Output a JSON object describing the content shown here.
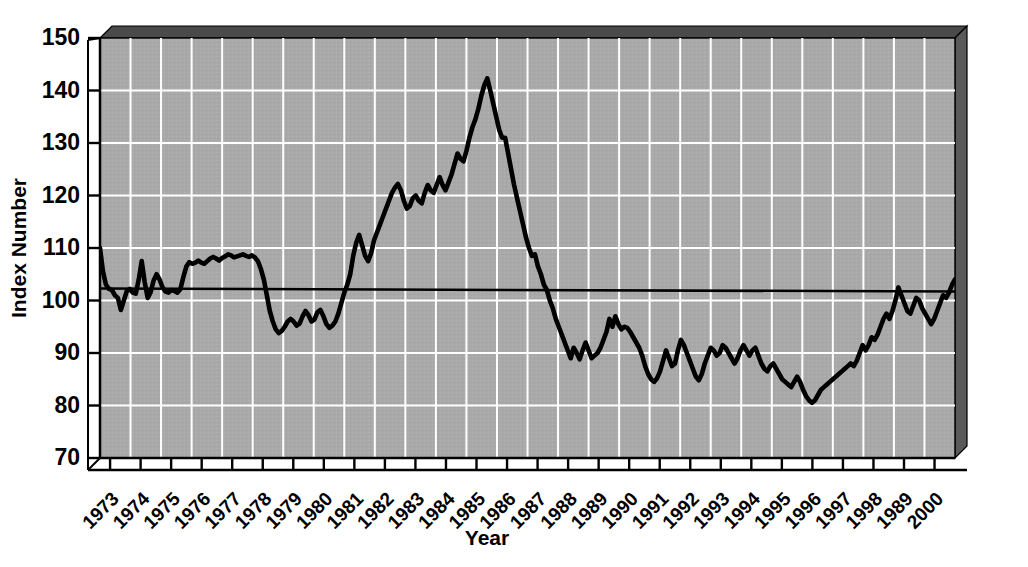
{
  "chart_data": {
    "type": "line",
    "title": "",
    "xlabel": "Year",
    "ylabel": "Index Number",
    "ylim": [
      70,
      150
    ],
    "yticks": [
      70,
      80,
      90,
      100,
      110,
      120,
      130,
      140,
      150
    ],
    "grid": true,
    "legend": null,
    "background_color": "#a9a9a9",
    "gridline_color": "#ffffff",
    "line_color": "#000000",
    "reference_line": {
      "value": 102,
      "color": "#000000",
      "label": ""
    },
    "xtick_labels": [
      "1973",
      "1974",
      "1975",
      "1976",
      "1977",
      "1978",
      "1979",
      "1980",
      "1981",
      "1982",
      "1983",
      "1984",
      "1985",
      "1986",
      "1987",
      "1988",
      "1989",
      "1990",
      "1991",
      "1992",
      "1993",
      "1994",
      "1995",
      "1996",
      "1997",
      "1998",
      "1989",
      "2000"
    ],
    "x_start": 1973.0,
    "x_end": 2000.75,
    "x_step_years": 0.0833333,
    "series": [
      {
        "name": "Index Number",
        "values": [
          110.0,
          105.5,
          103.0,
          102.2,
          102.0,
          101.0,
          100.5,
          98.2,
          100.0,
          101.8,
          102.2,
          101.5,
          101.3,
          104.0,
          107.5,
          103.5,
          100.5,
          101.6,
          103.8,
          105.0,
          104.0,
          102.5,
          101.7,
          101.5,
          102.0,
          101.8,
          101.5,
          102.2,
          104.5,
          106.5,
          107.3,
          107.0,
          107.2,
          107.6,
          107.2,
          107.0,
          107.5,
          108.0,
          108.3,
          108.0,
          107.6,
          108.1,
          108.4,
          108.8,
          108.6,
          108.2,
          108.4,
          108.6,
          108.8,
          108.5,
          108.3,
          108.6,
          108.2,
          107.5,
          106.0,
          104.0,
          101.0,
          98.0,
          96.0,
          94.5,
          93.8,
          94.2,
          95.0,
          96.0,
          96.5,
          96.0,
          95.2,
          95.6,
          97.0,
          98.0,
          97.2,
          96.0,
          96.4,
          97.8,
          98.2,
          97.0,
          95.5,
          94.8,
          95.2,
          96.0,
          97.5,
          99.5,
          101.5,
          103.0,
          105.0,
          108.5,
          111.0,
          112.5,
          110.5,
          108.5,
          107.5,
          109.0,
          111.5,
          113.0,
          114.5,
          116.0,
          117.5,
          119.0,
          120.5,
          121.5,
          122.2,
          121.0,
          119.0,
          117.5,
          118.0,
          119.5,
          120.0,
          119.0,
          118.5,
          120.5,
          122.0,
          121.0,
          120.5,
          122.0,
          123.5,
          122.0,
          121.0,
          122.5,
          124.0,
          126.0,
          128.0,
          127.0,
          126.5,
          128.5,
          131.0,
          133.0,
          134.5,
          136.5,
          139.0,
          141.0,
          142.3,
          140.0,
          137.5,
          135.0,
          132.5,
          131.0,
          131.0,
          128.0,
          125.0,
          122.0,
          119.5,
          117.0,
          114.5,
          112.0,
          110.0,
          108.5,
          108.8,
          106.5,
          105.0,
          103.0,
          102.0,
          100.0,
          98.5,
          96.5,
          95.0,
          93.5,
          92.0,
          90.5,
          89.0,
          91.0,
          90.0,
          88.8,
          90.5,
          92.0,
          90.5,
          89.0,
          89.5,
          90.0,
          91.0,
          92.5,
          94.0,
          96.5,
          95.0,
          97.0,
          95.5,
          94.5,
          95.0,
          94.8,
          94.0,
          93.0,
          92.0,
          91.0,
          89.5,
          87.5,
          86.0,
          85.0,
          84.5,
          85.2,
          86.5,
          88.5,
          90.5,
          89.0,
          87.5,
          88.0,
          90.5,
          92.5,
          91.5,
          90.0,
          88.5,
          87.0,
          85.5,
          84.8,
          86.0,
          88.0,
          89.5,
          91.0,
          90.5,
          89.5,
          90.0,
          91.5,
          91.0,
          90.0,
          89.0,
          88.0,
          89.0,
          90.5,
          91.5,
          90.5,
          89.5,
          90.5,
          91.0,
          89.5,
          88.0,
          87.0,
          86.5,
          87.5,
          88.0,
          87.0,
          86.0,
          85.0,
          84.5,
          84.0,
          83.5,
          84.5,
          85.5,
          84.5,
          83.0,
          81.8,
          81.0,
          80.5,
          81.0,
          82.0,
          83.0,
          83.5,
          84.0,
          84.5,
          85.0,
          85.5,
          86.0,
          86.5,
          87.0,
          87.5,
          88.0,
          87.5,
          88.5,
          90.0,
          91.5,
          90.5,
          91.5,
          93.0,
          92.5,
          93.5,
          95.0,
          96.5,
          97.5,
          96.5,
          98.0,
          100.0,
          102.5,
          101.0,
          99.5,
          98.0,
          97.5,
          99.0,
          100.5,
          100.0,
          98.5,
          97.5,
          96.5,
          95.5,
          96.5,
          98.0,
          99.5,
          101.0,
          100.5,
          101.5,
          103.0,
          104.0
        ]
      }
    ]
  },
  "axes": {
    "y_title": "Index Number",
    "x_title": "Year"
  }
}
